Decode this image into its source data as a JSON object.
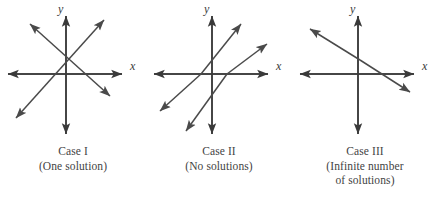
{
  "figure": {
    "background_color": "#ffffff",
    "line_color": "#4a4a4a",
    "axis_color": "#3a3a3a",
    "text_color": "#434343",
    "cases": [
      {
        "id": "case-1",
        "title": "Case I",
        "subtitle": "(One solution)",
        "subtitle_line2": "",
        "x_axis_label": "x",
        "y_axis_label": "y",
        "description": "Two lines intersecting at one point",
        "lines": [
          {
            "name": "line-a",
            "x1": 16,
            "y1": 118,
            "x2": 104,
            "y2": 20,
            "slope": "positive"
          },
          {
            "name": "line-b",
            "x1": 30,
            "y1": 24,
            "x2": 110,
            "y2": 96,
            "slope": "negative"
          }
        ]
      },
      {
        "id": "case-2",
        "title": "Case II",
        "subtitle": "(No solutions)",
        "subtitle_line2": "",
        "x_axis_label": "x",
        "y_axis_label": "y",
        "description": "Two parallel lines that never intersect",
        "lines": [
          {
            "name": "line-a",
            "x1": 14,
            "y1": 111,
            "x2": 95,
            "y2": 24,
            "slope": "positive"
          },
          {
            "name": "line-b",
            "x1": 40,
            "y1": 131,
            "x2": 121,
            "y2": 44,
            "slope": "positive"
          }
        ]
      },
      {
        "id": "case-3",
        "title": "Case III",
        "subtitle": "(Infinite number",
        "subtitle_line2": "of solutions)",
        "x_axis_label": "x",
        "y_axis_label": "y",
        "description": "Two coincident lines lying on top of each other",
        "lines": [
          {
            "name": "line-a",
            "x1": 18,
            "y1": 29,
            "x2": 118,
            "y2": 92,
            "slope": "negative"
          }
        ]
      }
    ],
    "axes": {
      "x_start": 8,
      "x_end": 122,
      "y_start": 16,
      "y_end": 134,
      "origin_x": 66,
      "origin_y": 74
    }
  }
}
